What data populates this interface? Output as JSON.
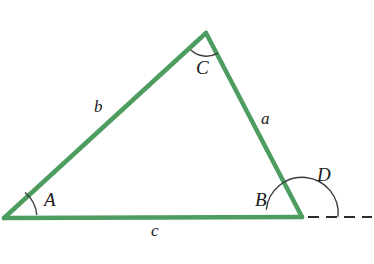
{
  "figure": {
    "type": "geometry-diagram",
    "background_color": "#ffffff",
    "stroke_color_triangle": "#4d9c60",
    "stroke_color_arc": "#3a3a3a",
    "stroke_color_dashed": "#2b2b2b",
    "label_color": "#1a1a1a"
  },
  "vertices": [
    {
      "name": "A",
      "x": 4,
      "y": 218
    },
    {
      "name": "B",
      "x": 302,
      "y": 217
    },
    {
      "name": "C",
      "x": 206,
      "y": 33
    }
  ],
  "labels": {
    "angle_A": "A",
    "angle_B": "B",
    "angle_C": "C",
    "angle_D": "D",
    "side_a": "a",
    "side_b": "b",
    "side_c": "c"
  },
  "label_positions": {
    "angle_A": {
      "x": 44,
      "y": 190
    },
    "angle_B": {
      "x": 255,
      "y": 190
    },
    "angle_C": {
      "x": 196,
      "y": 58
    },
    "angle_D": {
      "x": 317,
      "y": 165
    },
    "side_a": {
      "x": 261,
      "y": 110
    },
    "side_b": {
      "x": 94,
      "y": 98
    },
    "side_c": {
      "x": 151,
      "y": 222
    }
  },
  "arcs": {
    "angle_A": {
      "center_x": 4,
      "center_y": 218,
      "radius": 33
    },
    "angle_C": {
      "center_x": 206,
      "center_y": 33,
      "radius": 23
    },
    "angle_D": {
      "center_x": 302,
      "center_y": 217,
      "radius": 36
    }
  },
  "dashed_extension": {
    "from_x": 308,
    "to_x": 372,
    "y": 217
  }
}
